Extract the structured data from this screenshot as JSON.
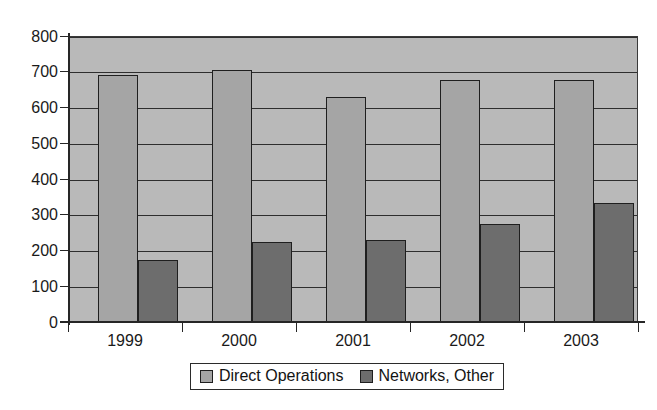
{
  "chart_data": {
    "type": "bar",
    "title": "",
    "xlabel": "",
    "ylabel": "",
    "categories": [
      "1999",
      "2000",
      "2001",
      "2002",
      "2003"
    ],
    "series": [
      {
        "name": "Direct Operations",
        "color": "#a5a5a5",
        "values": [
          691,
          705,
          629,
          677,
          678
        ]
      },
      {
        "name": "Networks, Other",
        "color": "#6d6d6d",
        "values": [
          173,
          224,
          229,
          274,
          333
        ]
      }
    ],
    "ylim": [
      0,
      800
    ],
    "ytick_step": 100,
    "yticks": [
      "0",
      "100",
      "200",
      "300",
      "400",
      "500",
      "600",
      "700",
      "800"
    ],
    "grid": true,
    "grid_axis": "y",
    "legend_position": "bottom-center",
    "plot_background": "#b9b9b9",
    "axis_color": "#262626"
  }
}
